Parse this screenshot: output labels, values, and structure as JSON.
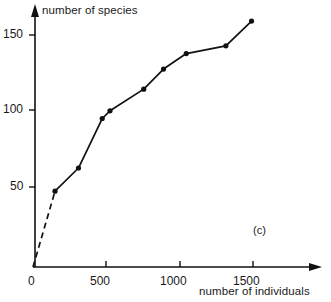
{
  "chart_data": {
    "type": "line",
    "title": "",
    "subtitle": "",
    "panel_label": "(c)",
    "xlabel": "number of individuals",
    "ylabel": "number of species",
    "xlim": [
      0,
      1630
    ],
    "ylim": [
      0,
      172
    ],
    "xticks": [
      0,
      500,
      1000,
      1500
    ],
    "xtick_labels": [
      "0",
      "500",
      "1000",
      "1500"
    ],
    "yticks": [
      50,
      100,
      150
    ],
    "ytick_labels": [
      "50",
      "100",
      "150"
    ],
    "grid": false,
    "legend": null,
    "series": [
      {
        "name": "species accumulation",
        "marker": "filled-circle",
        "line_color": "#111111",
        "x": [
          150,
          310,
          472,
          525,
          755,
          890,
          1045,
          1315,
          1490
        ],
        "y": [
          49,
          64,
          96,
          101,
          115,
          128,
          138,
          143,
          159
        ],
        "points": [
          {
            "x": 150,
            "y": 49
          },
          {
            "x": 310,
            "y": 64
          },
          {
            "x": 472,
            "y": 96
          },
          {
            "x": 525,
            "y": 101
          },
          {
            "x": 755,
            "y": 115
          },
          {
            "x": 890,
            "y": 128
          },
          {
            "x": 1045,
            "y": 138
          },
          {
            "x": 1315,
            "y": 143
          },
          {
            "x": 1490,
            "y": 159
          }
        ]
      }
    ],
    "extrapolation_segment": {
      "style": "dashed",
      "from": {
        "x": 0,
        "y": 0
      },
      "to": {
        "x": 150,
        "y": 49
      }
    },
    "annotations": [],
    "axis_style": {
      "arrow_heads": true,
      "spines": [
        "left",
        "bottom"
      ],
      "color": "#111111"
    }
  },
  "colors": {
    "ink": "#111111",
    "text": "#1a1a1a",
    "background": "#ffffff"
  },
  "labels": {
    "y_axis_title": "number of species",
    "x_axis_title": "number of individuals",
    "panel": "(c)",
    "x_tick_0": "0",
    "x_tick_500": "500",
    "x_tick_1000": "1000",
    "x_tick_1500": "1500",
    "y_tick_50": "50",
    "y_tick_100": "100",
    "y_tick_150": "150"
  }
}
